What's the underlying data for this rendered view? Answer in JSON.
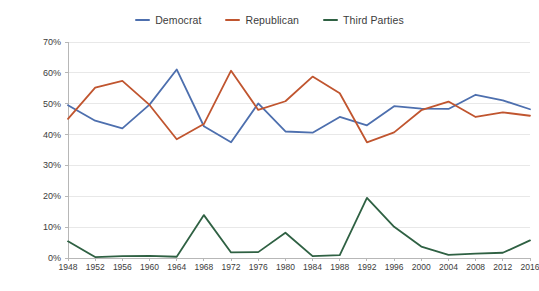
{
  "chart_data": {
    "type": "line",
    "title": "",
    "xlabel": "",
    "ylabel": "Percentage of Total Vote",
    "x": [
      1948,
      1952,
      1956,
      1960,
      1964,
      1968,
      1972,
      1976,
      1980,
      1984,
      1988,
      1992,
      1996,
      2000,
      2004,
      2008,
      2012,
      2016
    ],
    "xtick_labels": [
      "1948",
      "1952",
      "1956",
      "1960",
      "1964",
      "1968",
      "1972",
      "1976",
      "1980",
      "1984",
      "1988",
      "1992",
      "1996",
      "2000",
      "2004",
      "2008",
      "2012",
      "2016"
    ],
    "ytick_labels": [
      "0%",
      "10%",
      "20%",
      "30%",
      "40%",
      "50%",
      "60%",
      "70%"
    ],
    "ytick_values": [
      0,
      10,
      20,
      30,
      40,
      50,
      60,
      70
    ],
    "ylim": [
      0,
      70
    ],
    "xlim": [
      1948,
      2016
    ],
    "grid": true,
    "grid_axis": "y",
    "legend_position": "top-center",
    "series": [
      {
        "name": "Democrat",
        "color": "#4d6fae",
        "values": [
          49.5,
          44.5,
          42.0,
          49.7,
          61.1,
          42.7,
          37.5,
          50.1,
          41.0,
          40.6,
          45.7,
          43.0,
          49.2,
          48.4,
          48.3,
          52.9,
          51.1,
          48.2
        ]
      },
      {
        "name": "Republican",
        "color": "#c0552f",
        "values": [
          45.1,
          55.2,
          57.4,
          49.6,
          38.5,
          43.4,
          60.7,
          48.0,
          50.8,
          58.8,
          53.4,
          37.5,
          40.7,
          47.9,
          50.7,
          45.7,
          47.2,
          46.1
        ]
      },
      {
        "name": "Third Parties",
        "color": "#2f6143",
        "values": [
          5.4,
          0.3,
          0.6,
          0.7,
          0.4,
          13.9,
          1.8,
          1.9,
          8.2,
          0.6,
          0.9,
          19.5,
          10.1,
          3.7,
          1.0,
          1.4,
          1.7,
          5.7
        ]
      }
    ]
  },
  "legend": {
    "items": [
      {
        "label": "Democrat",
        "color": "#4d6fae"
      },
      {
        "label": "Republican",
        "color": "#c0552f"
      },
      {
        "label": "Third Parties",
        "color": "#2f6143"
      }
    ]
  },
  "axes": {
    "y_title": "Percentage of Total Vote"
  },
  "style": {
    "grid_color": "#e8e8e8",
    "axis_color": "#b7b7b7",
    "text_color": "#3c3c3c",
    "background": "#ffffff"
  }
}
